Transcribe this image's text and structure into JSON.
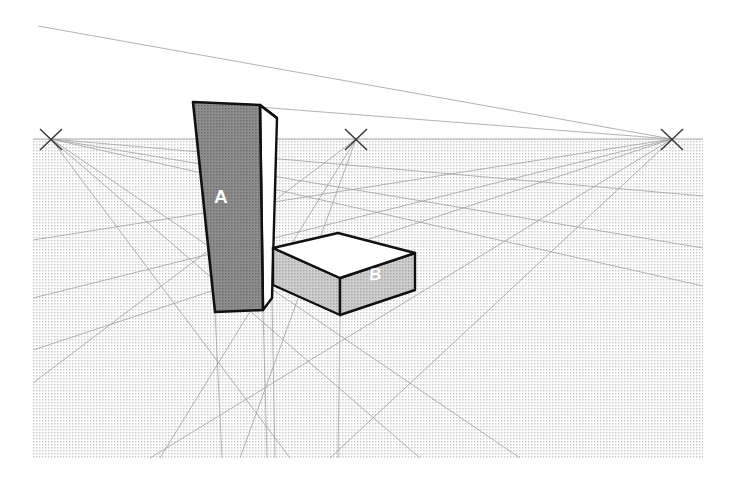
{
  "figure": {
    "type": "perspective-construction-diagram",
    "canvas": {
      "width": 734,
      "height": 480,
      "background": "#ffffff"
    }
  },
  "colors": {
    "outline": "#111111",
    "construction_line": "#8a8a8a",
    "horizon_line": "#9a9a9a",
    "ground_tone": "#d8d8d8",
    "shaded_face": "#8c8c8c",
    "mid_face": "#b8b8b8",
    "light_face": "#ffffff",
    "label_text": "#ffffff",
    "vp_mark": "#3a3a3a"
  },
  "ground_plane": {
    "name": "dotted-ground-plane",
    "x": 33,
    "y": 139,
    "width": 670,
    "height": 319,
    "fill_pattern": "fine-dot-screen"
  },
  "horizon": {
    "label": "horizon-line",
    "y": 139,
    "x_start": 33,
    "x_end": 703
  },
  "vanishing_points": [
    {
      "id": "vp-left",
      "label": "VPL",
      "x": 51,
      "y": 139,
      "mark": "x-cross",
      "size": 11
    },
    {
      "id": "vp-center",
      "label": "VPC",
      "x": 356,
      "y": 139,
      "mark": "x-cross",
      "size": 11
    },
    {
      "id": "vp-right",
      "label": "VPR",
      "x": 672,
      "y": 139,
      "mark": "x-cross",
      "size": 11
    }
  ],
  "solids": [
    {
      "id": "solid-a",
      "label": "A",
      "kind": "tall-tower",
      "front_face_tone": "shaded",
      "side_face_tone": "light",
      "top_face_tone": "light",
      "vertices": {
        "front_top_left": [
          193,
          102
        ],
        "front_top_right": [
          260,
          105
        ],
        "front_bottom_right": [
          263,
          310
        ],
        "front_bottom_left": [
          215,
          312
        ],
        "back_top_right": [
          277,
          118
        ],
        "back_bottom_right": [
          272,
          298
        ]
      }
    },
    {
      "id": "solid-b",
      "label": "B",
      "kind": "low-slab",
      "front_face_tone": "mid",
      "side_face_tone": "mid",
      "top_face_tone": "light",
      "vertices": {
        "top_left": [
          273,
          248
        ],
        "top_back": [
          338,
          233
        ],
        "top_right": [
          415,
          253
        ],
        "top_front": [
          340,
          278
        ],
        "bottom_left": [
          273,
          285
        ],
        "bottom_front": [
          340,
          315
        ],
        "bottom_right": [
          415,
          290
        ]
      }
    }
  ],
  "construction_lines": {
    "from_left_vp": 6,
    "from_center_vp": 3,
    "from_right_vp": 5,
    "to_bottom_vp": 4,
    "note": "light grey guide rays converging on the three x-marked vanishing points"
  },
  "labels": {
    "solid_a": "A",
    "solid_b": "B"
  }
}
